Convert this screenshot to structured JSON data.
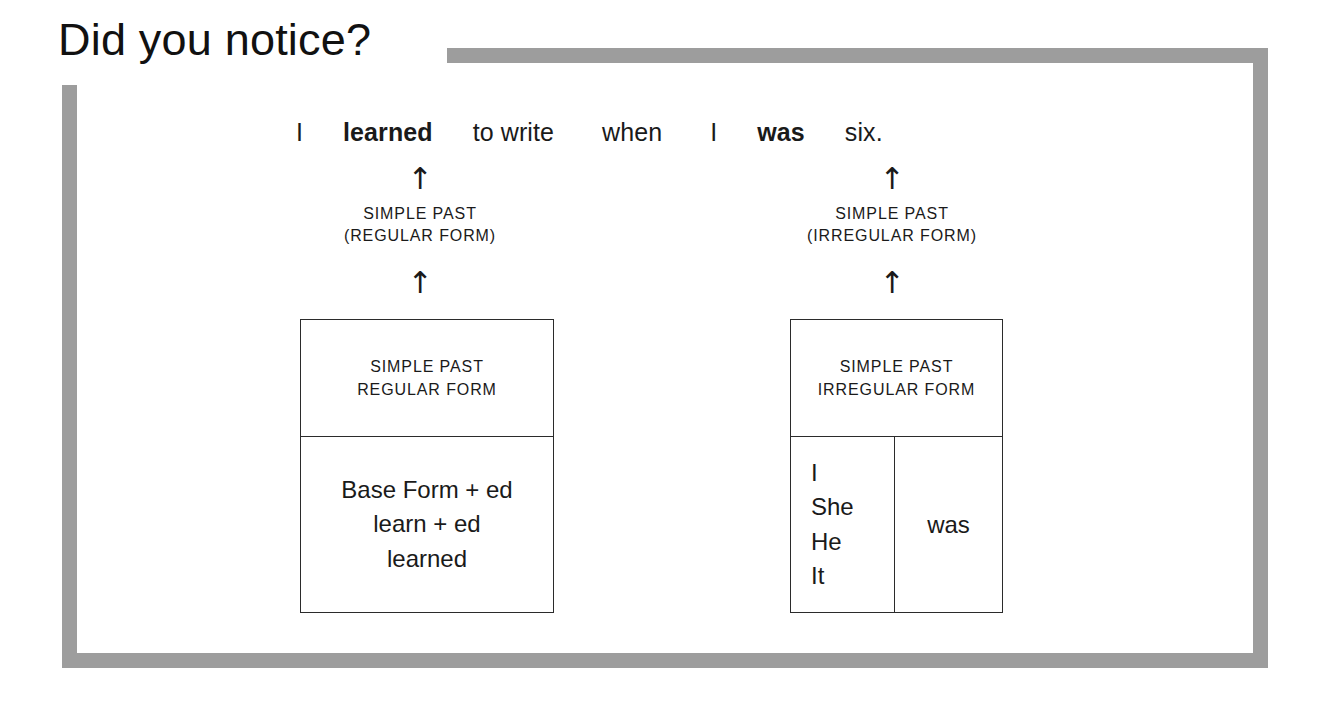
{
  "page": {
    "title": "Did you notice?",
    "background_color": "#ffffff",
    "frame_color": "#9d9d9d",
    "text_color": "#1a1a1a"
  },
  "sentence": {
    "words": [
      {
        "text": "I",
        "bold": false
      },
      {
        "text": "learned",
        "bold": true
      },
      {
        "text": "to write",
        "bold": false
      },
      {
        "text": "when",
        "bold": false
      },
      {
        "text": "I",
        "bold": false
      },
      {
        "text": "was",
        "bold": true
      },
      {
        "text": "six.",
        "bold": false
      }
    ],
    "full_text": "I learned to write when I was six."
  },
  "arrows": {
    "glyph": "↑",
    "left_top_name": "arrow-up-to-learned",
    "left_bottom_name": "arrow-up-to-regular-caption",
    "right_top_name": "arrow-up-to-was",
    "right_bottom_name": "arrow-up-to-irregular-caption"
  },
  "captions": {
    "left": {
      "line1": "SIMPLE PAST",
      "line2": "(REGULAR FORM)"
    },
    "right": {
      "line1": "SIMPLE PAST",
      "line2": "(IRREGULAR FORM)"
    }
  },
  "boxes": {
    "left": {
      "header": {
        "line1": "SIMPLE PAST",
        "line2": "REGULAR FORM"
      },
      "body": {
        "line1": "Base Form + ed",
        "line2": "learn + ed",
        "line3": "learned"
      }
    },
    "right": {
      "header": {
        "line1": "SIMPLE PAST",
        "line2": "IRREGULAR FORM"
      },
      "body": {
        "pronouns": [
          "I",
          "She",
          "He",
          "It"
        ],
        "verb": "was"
      }
    }
  }
}
